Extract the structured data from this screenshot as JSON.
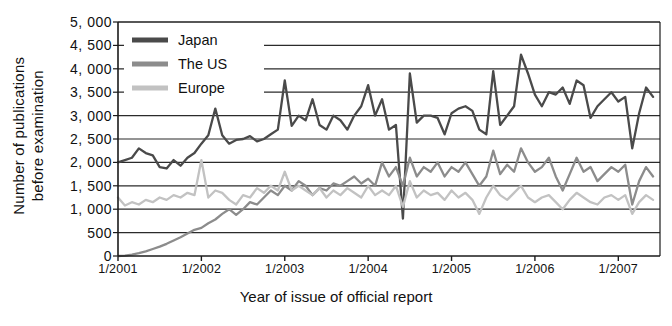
{
  "chart_data": {
    "type": "line",
    "title": "",
    "xlabel": "Year of issue of official report",
    "ylabel": "Number of publications\nbefore examination",
    "ylabel_line1": "Number of publications",
    "ylabel_line2": "before examination",
    "ylim": [
      0,
      5000
    ],
    "ytick_labels": [
      "5, 000",
      "4, 500",
      "4, 000",
      "3, 500",
      "3, 000",
      "2, 500",
      "2, 000",
      "1, 500",
      "1, 000",
      "500",
      "0"
    ],
    "ytick_values": [
      5000,
      4500,
      4000,
      3500,
      3000,
      2500,
      2000,
      1500,
      1000,
      500,
      0
    ],
    "xtick_labels": [
      "1/2001",
      "1/2002",
      "1/2003",
      "1/2004",
      "1/2005",
      "1/2006",
      "1/2007"
    ],
    "xtick_values": [
      2001,
      2002,
      2003,
      2004,
      2005,
      2006,
      2007
    ],
    "xlim": [
      2001,
      2007.5
    ],
    "grid": true,
    "grid_lines": [
      500,
      1000,
      1500,
      2000,
      2500,
      3000,
      3500,
      4000,
      4500,
      5000
    ],
    "legend_position": "top-left",
    "colors": {
      "japan": "#4a4a4a",
      "us": "#8c8c8c",
      "europe": "#c2c2c2",
      "axis": "#1a1a1a",
      "grid": "#2b2b2b",
      "background": "#ffffff"
    },
    "series": [
      {
        "name": "Japan",
        "color": "#4a4a4a",
        "x": [
          2001.0,
          2001.083,
          2001.167,
          2001.25,
          2001.333,
          2001.417,
          2001.5,
          2001.583,
          2001.667,
          2001.75,
          2001.833,
          2001.917,
          2002.0,
          2002.083,
          2002.167,
          2002.25,
          2002.333,
          2002.417,
          2002.5,
          2002.583,
          2002.667,
          2002.75,
          2002.833,
          2002.917,
          2003.0,
          2003.083,
          2003.167,
          2003.25,
          2003.333,
          2003.417,
          2003.5,
          2003.583,
          2003.667,
          2003.75,
          2003.833,
          2003.917,
          2004.0,
          2004.083,
          2004.167,
          2004.25,
          2004.333,
          2004.417,
          2004.5,
          2004.583,
          2004.667,
          2004.75,
          2004.833,
          2004.917,
          2005.0,
          2005.083,
          2005.167,
          2005.25,
          2005.333,
          2005.417,
          2005.5,
          2005.583,
          2005.667,
          2005.75,
          2005.833,
          2005.917,
          2006.0,
          2006.083,
          2006.167,
          2006.25,
          2006.333,
          2006.417,
          2006.5,
          2006.583,
          2006.667,
          2006.75,
          2006.833,
          2006.917,
          2007.0,
          2007.083,
          2007.167,
          2007.25,
          2007.333,
          2007.417
        ],
        "values": [
          2000,
          2050,
          2100,
          2300,
          2200,
          2150,
          1900,
          1870,
          2050,
          1930,
          2100,
          2200,
          2400,
          2580,
          3150,
          2580,
          2400,
          2480,
          2500,
          2560,
          2450,
          2500,
          2600,
          2700,
          3750,
          2780,
          3000,
          2900,
          3350,
          2800,
          2700,
          3000,
          2900,
          2700,
          3000,
          3200,
          3650,
          3000,
          3350,
          2700,
          2800,
          800,
          3900,
          2850,
          3000,
          3000,
          2950,
          2600,
          3050,
          3150,
          3200,
          3100,
          2700,
          2600,
          3950,
          2800,
          3000,
          3200,
          4300,
          3900,
          3450,
          3200,
          3500,
          3450,
          3600,
          3250,
          3750,
          3650,
          2950,
          3200,
          3350,
          3500,
          3300,
          3400,
          2300,
          3050,
          3600,
          3400
        ]
      },
      {
        "name": "The US",
        "color": "#8c8c8c",
        "x": [
          2001.0,
          2001.083,
          2001.167,
          2001.25,
          2001.333,
          2001.417,
          2001.5,
          2001.583,
          2001.667,
          2001.75,
          2001.833,
          2001.917,
          2002.0,
          2002.083,
          2002.167,
          2002.25,
          2002.333,
          2002.417,
          2002.5,
          2002.583,
          2002.667,
          2002.75,
          2002.833,
          2002.917,
          2003.0,
          2003.083,
          2003.167,
          2003.25,
          2003.333,
          2003.417,
          2003.5,
          2003.583,
          2003.667,
          2003.75,
          2003.833,
          2003.917,
          2004.0,
          2004.083,
          2004.167,
          2004.25,
          2004.333,
          2004.417,
          2004.5,
          2004.583,
          2004.667,
          2004.75,
          2004.833,
          2004.917,
          2005.0,
          2005.083,
          2005.167,
          2005.25,
          2005.333,
          2005.417,
          2005.5,
          2005.583,
          2005.667,
          2005.75,
          2005.833,
          2005.917,
          2006.0,
          2006.083,
          2006.167,
          2006.25,
          2006.333,
          2006.417,
          2006.5,
          2006.583,
          2006.667,
          2006.75,
          2006.833,
          2006.917,
          2007.0,
          2007.083,
          2007.167,
          2007.25,
          2007.333,
          2007.417
        ],
        "values": [
          0,
          10,
          30,
          60,
          100,
          150,
          200,
          260,
          330,
          400,
          480,
          560,
          600,
          700,
          780,
          900,
          1000,
          880,
          1000,
          1150,
          1100,
          1250,
          1400,
          1300,
          1500,
          1400,
          1600,
          1500,
          1300,
          1450,
          1400,
          1550,
          1500,
          1600,
          1700,
          1550,
          1650,
          1500,
          2000,
          1700,
          1900,
          1500,
          2100,
          1700,
          1900,
          1800,
          2000,
          1700,
          1900,
          1800,
          2000,
          1750,
          1500,
          1700,
          2250,
          1750,
          1950,
          1800,
          2300,
          2000,
          1800,
          1900,
          2100,
          1700,
          1400,
          1750,
          2100,
          1800,
          1900,
          1600,
          1750,
          1900,
          1800,
          1950,
          1100,
          1600,
          1900,
          1700
        ]
      },
      {
        "name": "Europe",
        "color": "#c2c2c2",
        "x": [
          2001.0,
          2001.083,
          2001.167,
          2001.25,
          2001.333,
          2001.417,
          2001.5,
          2001.583,
          2001.667,
          2001.75,
          2001.833,
          2001.917,
          2002.0,
          2002.083,
          2002.167,
          2002.25,
          2002.333,
          2002.417,
          2002.5,
          2002.583,
          2002.667,
          2002.75,
          2002.833,
          2002.917,
          2003.0,
          2003.083,
          2003.167,
          2003.25,
          2003.333,
          2003.417,
          2003.5,
          2003.583,
          2003.667,
          2003.75,
          2003.833,
          2003.917,
          2004.0,
          2004.083,
          2004.167,
          2004.25,
          2004.333,
          2004.417,
          2004.5,
          2004.583,
          2004.667,
          2004.75,
          2004.833,
          2004.917,
          2005.0,
          2005.083,
          2005.167,
          2005.25,
          2005.333,
          2005.417,
          2005.5,
          2005.583,
          2005.667,
          2005.75,
          2005.833,
          2005.917,
          2006.0,
          2006.083,
          2006.167,
          2006.25,
          2006.333,
          2006.417,
          2006.5,
          2006.583,
          2006.667,
          2006.75,
          2006.833,
          2006.917,
          2007.0,
          2007.083,
          2007.167,
          2007.25,
          2007.333,
          2007.417
        ],
        "values": [
          1250,
          1080,
          1150,
          1100,
          1200,
          1150,
          1250,
          1200,
          1300,
          1250,
          1350,
          1300,
          2050,
          1250,
          1400,
          1350,
          1200,
          1100,
          1300,
          1250,
          1450,
          1350,
          1500,
          1400,
          1800,
          1400,
          1500,
          1400,
          1300,
          1450,
          1250,
          1400,
          1300,
          1450,
          1350,
          1250,
          1500,
          1300,
          1400,
          1300,
          1500,
          1050,
          1600,
          1250,
          1400,
          1300,
          1350,
          1200,
          1400,
          1250,
          1350,
          1200,
          900,
          1250,
          1500,
          1300,
          1200,
          1350,
          1500,
          1250,
          1150,
          1250,
          1300,
          1150,
          1000,
          1200,
          1350,
          1250,
          1150,
          1100,
          1250,
          1300,
          1200,
          1300,
          900,
          1150,
          1300,
          1200
        ]
      }
    ]
  },
  "legend": {
    "items": [
      {
        "label": "Japan",
        "color": "#4a4a4a"
      },
      {
        "label": "The US",
        "color": "#8c8c8c"
      },
      {
        "label": "Europe",
        "color": "#c2c2c2"
      }
    ]
  }
}
